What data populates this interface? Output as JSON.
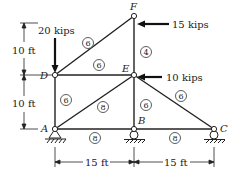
{
  "diagram": {
    "type": "truss",
    "nodes": [
      {
        "id": "A",
        "x": 55,
        "y": 129,
        "label": "A"
      },
      {
        "id": "B",
        "x": 134,
        "y": 129,
        "label": "B"
      },
      {
        "id": "C",
        "x": 214,
        "y": 129,
        "label": "C"
      },
      {
        "id": "D",
        "x": 55,
        "y": 75,
        "label": "D"
      },
      {
        "id": "E",
        "x": 134,
        "y": 75,
        "label": "E"
      },
      {
        "id": "F",
        "x": 134,
        "y": 16,
        "label": "F"
      }
    ],
    "members": [
      {
        "from": "A",
        "to": "D",
        "value": "6"
      },
      {
        "from": "D",
        "to": "F",
        "value": "6"
      },
      {
        "from": "D",
        "to": "E",
        "value": "6"
      },
      {
        "from": "F",
        "to": "E",
        "value": "4"
      },
      {
        "from": "A",
        "to": "E",
        "value": "8"
      },
      {
        "from": "E",
        "to": "B",
        "value": "6"
      },
      {
        "from": "E",
        "to": "C",
        "value": "6"
      },
      {
        "from": "A",
        "to": "B",
        "value": "8"
      },
      {
        "from": "B",
        "to": "C",
        "value": "8"
      }
    ],
    "loads": [
      {
        "node": "D",
        "label": "20 kips",
        "direction": "down"
      },
      {
        "node": "F",
        "label": "15 kips",
        "direction": "left"
      },
      {
        "node": "E",
        "label": "10 kips",
        "direction": "left"
      }
    ],
    "dimensions": {
      "vertical_top": "10 ft",
      "vertical_bottom": "10 ft",
      "horizontal_left": "15 ft",
      "horizontal_right": "15 ft"
    },
    "supports": [
      "A",
      "B",
      "C"
    ]
  }
}
